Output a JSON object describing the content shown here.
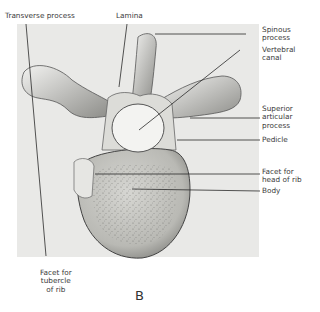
{
  "figure": {
    "panel_letter": "B",
    "labels": {
      "transverse_process": "Transverse process",
      "lamina": "Lamina",
      "spinous_process": "Spinous\nprocess",
      "vertebral_canal": "Vertebral\ncanal",
      "superior_articular_process": "Superior\narticular\nprocess",
      "pedicle": "Pedicle",
      "facet_head_of_rib": "Facet for\nhead of rib",
      "body": "Body",
      "facet_tubercle_of_rib": "Facet for\ntubercle\nof rib"
    },
    "colors": {
      "background": "#ffffff",
      "panel": "#e9e9e7",
      "bone_light": "#d9d9d6",
      "bone_shadow": "#5a5a5a",
      "leader_line": "#2a2a2a",
      "text": "#3a3a3a"
    }
  }
}
